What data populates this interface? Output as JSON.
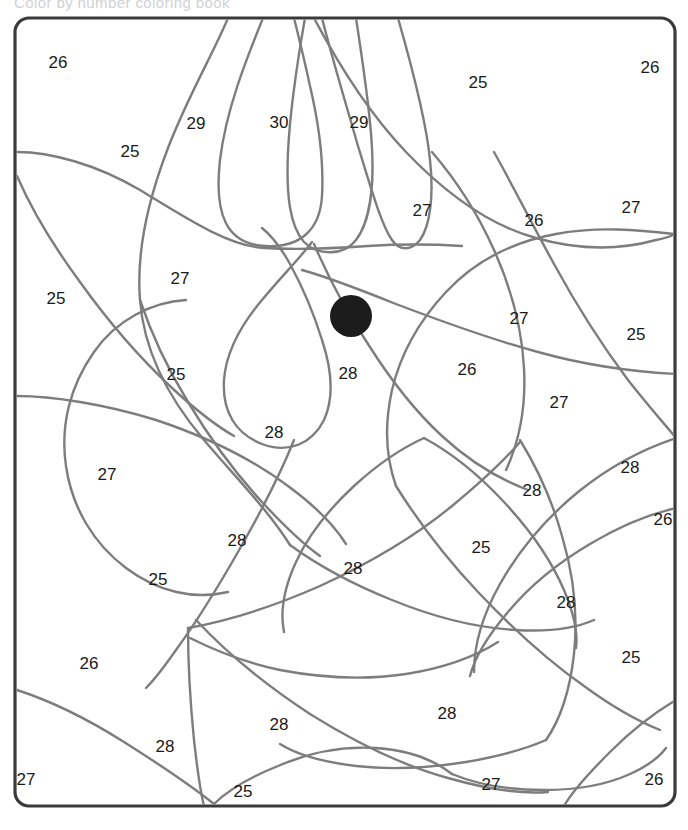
{
  "header": {
    "title": "Color by number coloring book"
  },
  "canvas": {
    "width": 688,
    "height": 830,
    "background": "#ffffff"
  },
  "frame": {
    "x": 15,
    "y": 18,
    "width": 660,
    "height": 788,
    "corner_radius": 14,
    "stroke": "#3a3a3a",
    "stroke_width": 3.2,
    "fill": "#ffffff"
  },
  "style": {
    "line_color": "#7d7d7d",
    "line_width": 2.4,
    "number_color": "#1a1a1a",
    "number_size": 17,
    "dot_color": "#1c1c1c"
  },
  "eye_dot": {
    "name": "eye-dot",
    "cx": 351,
    "cy": 316,
    "r": 21,
    "color": "#1c1c1c"
  },
  "legend": {
    "min_number": 25,
    "max_number": 30,
    "distinct_numbers": [
      25,
      26,
      27,
      28,
      29,
      30
    ]
  },
  "region_numbers": [
    {
      "id": "r01",
      "value": "26",
      "x": 58,
      "y": 64
    },
    {
      "id": "r02",
      "value": "25",
      "x": 130,
      "y": 153
    },
    {
      "id": "r03",
      "value": "29",
      "x": 196,
      "y": 125
    },
    {
      "id": "r04",
      "value": "30",
      "x": 279,
      "y": 124
    },
    {
      "id": "r05",
      "value": "29",
      "x": 359,
      "y": 124
    },
    {
      "id": "r06",
      "value": "25",
      "x": 478,
      "y": 84
    },
    {
      "id": "r07",
      "value": "26",
      "x": 650,
      "y": 69
    },
    {
      "id": "r08",
      "value": "27",
      "x": 422,
      "y": 212
    },
    {
      "id": "r09",
      "value": "26",
      "x": 534,
      "y": 222
    },
    {
      "id": "r10",
      "value": "27",
      "x": 631,
      "y": 209
    },
    {
      "id": "r11",
      "value": "27",
      "x": 180,
      "y": 280
    },
    {
      "id": "r12",
      "value": "25",
      "x": 56,
      "y": 300
    },
    {
      "id": "r13",
      "value": "27",
      "x": 519,
      "y": 320
    },
    {
      "id": "r14",
      "value": "25",
      "x": 636,
      "y": 336
    },
    {
      "id": "r15",
      "value": "25",
      "x": 176,
      "y": 376
    },
    {
      "id": "r16",
      "value": "28",
      "x": 348,
      "y": 375
    },
    {
      "id": "r17",
      "value": "26",
      "x": 467,
      "y": 371
    },
    {
      "id": "r18",
      "value": "27",
      "x": 559,
      "y": 404
    },
    {
      "id": "r19",
      "value": "28",
      "x": 274,
      "y": 434
    },
    {
      "id": "r20",
      "value": "27",
      "x": 107,
      "y": 476
    },
    {
      "id": "r21",
      "value": "28",
      "x": 630,
      "y": 469
    },
    {
      "id": "r22",
      "value": "28",
      "x": 532,
      "y": 492
    },
    {
      "id": "r23",
      "value": "26",
      "x": 663,
      "y": 521
    },
    {
      "id": "r24",
      "value": "28",
      "x": 237,
      "y": 542
    },
    {
      "id": "r25",
      "value": "28",
      "x": 353,
      "y": 570
    },
    {
      "id": "r26",
      "value": "25",
      "x": 481,
      "y": 549
    },
    {
      "id": "r27",
      "value": "25",
      "x": 158,
      "y": 581
    },
    {
      "id": "r28",
      "value": "28",
      "x": 566,
      "y": 604
    },
    {
      "id": "r29",
      "value": "26",
      "x": 89,
      "y": 665
    },
    {
      "id": "r30",
      "value": "25",
      "x": 631,
      "y": 659
    },
    {
      "id": "r31",
      "value": "28",
      "x": 447,
      "y": 715
    },
    {
      "id": "r32",
      "value": "28",
      "x": 279,
      "y": 726
    },
    {
      "id": "r33",
      "value": "28",
      "x": 165,
      "y": 748
    },
    {
      "id": "r34",
      "value": "27",
      "x": 26,
      "y": 781
    },
    {
      "id": "r35",
      "value": "25",
      "x": 243,
      "y": 793
    },
    {
      "id": "r36",
      "value": "27",
      "x": 491,
      "y": 786
    },
    {
      "id": "r37",
      "value": "26",
      "x": 654,
      "y": 781
    }
  ],
  "boundary_paths": [
    {
      "id": "p01",
      "d": "M 228 18 C 214 52 188 96 168 148 C 148 200 136 250 140 300 C 144 352 170 400 204 440 C 238 480 268 510 290 545"
    },
    {
      "id": "p02",
      "d": "M 263 18 C 246 60 226 110 220 160 C 214 214 226 244 265 246 C 300 248 320 230 322 196 C 324 160 318 120 310 86 C 304 58 298 34 294 18"
    },
    {
      "id": "p03",
      "d": "M 305 18 C 298 58 290 110 288 152 C 286 196 290 226 304 242 C 318 256 344 256 356 240 C 370 222 374 186 372 148 C 370 108 362 58 356 18"
    },
    {
      "id": "p04",
      "d": "M 322 18 C 332 58 346 104 358 146 C 372 192 382 226 392 240 C 400 252 412 250 420 240 C 430 226 434 196 430 160 C 426 118 410 60 398 18"
    },
    {
      "id": "p05",
      "d": "M 17 152 C 50 152 96 164 140 190 C 186 218 228 246 264 248 C 300 250 340 248 368 246 C 400 244 430 244 462 246"
    },
    {
      "id": "p06",
      "d": "M 314 18 C 334 56 366 110 406 152 C 448 196 492 226 536 238 C 578 250 620 250 656 240 C 666 238 672 236 674 234"
    },
    {
      "id": "p07",
      "d": "M 312 242 C 300 258 282 276 262 300 C 240 326 226 352 224 380 C 222 412 236 434 262 444 C 288 454 312 444 324 420 C 334 398 332 370 322 340 C 314 314 302 286 290 264 C 280 246 272 236 262 228"
    },
    {
      "id": "p08",
      "d": "M 314 244 C 326 272 344 308 368 344 C 392 382 418 414 442 436 C 468 460 496 478 528 490"
    },
    {
      "id": "p09",
      "d": "M 432 152 C 456 180 478 214 494 250 C 512 290 522 330 524 368 C 526 406 520 440 506 470"
    },
    {
      "id": "p10",
      "d": "M 674 234 C 640 230 598 226 556 234 C 512 242 474 262 446 292 C 418 322 400 356 392 390 C 384 426 386 458 396 486"
    },
    {
      "id": "p11",
      "d": "M 494 152 C 512 184 532 224 554 264 C 578 308 604 348 628 380 C 650 408 668 428 676 438"
    },
    {
      "id": "p12",
      "d": "M 676 374 C 638 372 588 366 538 352 C 486 338 438 320 396 304 C 356 288 324 276 302 270"
    },
    {
      "id": "p13",
      "d": "M 186 300 C 152 302 116 320 94 352 C 70 386 60 426 66 466 C 72 508 94 544 126 568 C 158 592 194 600 228 592"
    },
    {
      "id": "p14",
      "d": "M 17 396 C 52 396 104 404 156 420 C 210 438 256 462 288 486 C 318 508 336 528 346 544"
    },
    {
      "id": "p15",
      "d": "M 294 440 C 282 470 262 510 238 552 C 214 594 192 628 176 650 C 162 670 152 682 146 688"
    },
    {
      "id": "p16",
      "d": "M 188 628 C 222 622 270 608 320 586 C 372 562 418 534 452 506 C 486 478 508 456 520 442"
    },
    {
      "id": "p17",
      "d": "M 196 620 C 224 650 264 684 310 714 C 358 744 404 766 448 778 C 490 790 524 794 548 792"
    },
    {
      "id": "p18",
      "d": "M 188 628 C 188 660 190 700 194 740 C 198 776 202 798 204 806"
    },
    {
      "id": "p19",
      "d": "M 17 690 C 48 700 86 718 124 742 C 162 766 194 788 214 804"
    },
    {
      "id": "p20",
      "d": "M 190 638 C 210 648 242 662 280 670 C 322 678 366 680 406 674 C 444 668 476 656 498 642"
    },
    {
      "id": "p21",
      "d": "M 520 440 C 536 466 552 500 562 536 C 574 576 578 616 574 654 C 570 690 560 720 546 740"
    },
    {
      "id": "p22",
      "d": "M 676 438 C 646 448 610 466 578 492 C 544 520 518 552 500 584 C 482 616 474 646 474 672"
    },
    {
      "id": "p23",
      "d": "M 396 486 C 416 518 444 556 478 592 C 514 630 550 662 584 686 C 614 708 640 722 660 730"
    },
    {
      "id": "p24",
      "d": "M 676 700 C 656 712 632 730 610 752 C 588 774 572 792 564 806"
    },
    {
      "id": "p25",
      "d": "M 546 740 C 528 748 500 756 466 762 C 428 768 390 770 356 766 C 322 762 296 754 280 744"
    },
    {
      "id": "p26",
      "d": "M 214 804 C 226 792 248 778 278 766 C 310 752 344 746 376 748 C 408 750 434 760 452 774"
    },
    {
      "id": "p27",
      "d": "M 452 774 C 476 784 508 790 544 790 C 578 790 608 784 630 774 C 648 766 660 756 666 748"
    },
    {
      "id": "p28",
      "d": "M 140 300 C 150 330 166 366 188 402 C 212 442 238 476 262 502 C 286 528 306 546 320 556"
    },
    {
      "id": "p29",
      "d": "M 290 545 C 316 564 352 584 392 600 C 436 618 478 628 516 630 C 550 632 576 628 594 620"
    },
    {
      "id": "p30",
      "d": "M 424 438 C 402 448 378 464 354 486 C 328 510 308 536 296 562 C 284 588 280 612 284 632"
    },
    {
      "id": "p31",
      "d": "M 424 438 C 450 452 478 474 504 502 C 532 532 552 562 564 590 C 574 614 578 634 576 648"
    },
    {
      "id": "p32",
      "d": "M 676 508 C 650 514 620 526 590 544 C 556 564 528 588 508 612 C 486 638 474 660 470 676"
    },
    {
      "id": "p33",
      "d": "M 17 176 C 30 206 52 244 80 282 C 110 324 142 360 172 388 C 198 412 220 428 234 436"
    }
  ]
}
